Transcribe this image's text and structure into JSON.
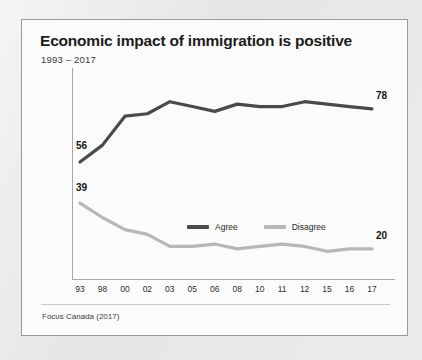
{
  "card": {
    "title": "Economic impact of immigration is positive",
    "subtitle": "1993 – 2017",
    "source": "Focus Canada (2017)"
  },
  "legend": {
    "agree_label": "Agree",
    "disagree_label": "Disagree",
    "position": "inside-center"
  },
  "colors": {
    "agree": "#4a4a4a",
    "disagree": "#b7b7b7",
    "axis": "#a7a7a7",
    "card_background": "#fbfbfb",
    "card_border": "#9a9a9a",
    "page_background": "#e9e9e9",
    "text": "#1d1d1d"
  },
  "chart_data": {
    "type": "line",
    "title": "Economic impact of immigration is positive",
    "subtitle": "1993 – 2017",
    "xlabel": "",
    "ylabel": "",
    "ylim": [
      0,
      100
    ],
    "grid": false,
    "legend_position": "inside-center",
    "categories": [
      "93",
      "98",
      "00",
      "02",
      "03",
      "05",
      "06",
      "08",
      "10",
      "11",
      "12",
      "15",
      "16",
      "17"
    ],
    "series": [
      {
        "name": "Agree",
        "color": "#4a4a4a",
        "values": [
          56,
          63,
          75,
          76,
          81,
          79,
          77,
          80,
          79,
          79,
          81,
          80,
          79,
          78
        ],
        "endpoint_labels": {
          "first": "56",
          "last": "78"
        }
      },
      {
        "name": "Disagree",
        "color": "#b7b7b7",
        "values": [
          39,
          33,
          28,
          26,
          21,
          21,
          22,
          20,
          21,
          22,
          21,
          19,
          20,
          20
        ],
        "endpoint_labels": {
          "first": "39",
          "last": "20"
        }
      }
    ],
    "annotations": [
      {
        "text": "56",
        "series": "Agree",
        "category": "93"
      },
      {
        "text": "78",
        "series": "Agree",
        "category": "17"
      },
      {
        "text": "39",
        "series": "Disagree",
        "category": "93"
      },
      {
        "text": "20",
        "series": "Disagree",
        "category": "17"
      }
    ]
  }
}
